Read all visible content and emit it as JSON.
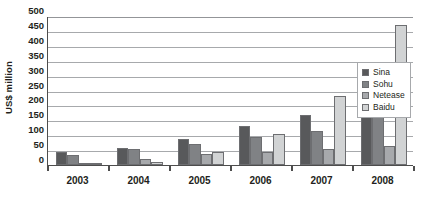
{
  "chart_data": {
    "type": "bar",
    "title": "",
    "xlabel": "",
    "ylabel": "US$ million",
    "ylim": [
      0,
      500
    ],
    "ytick_step": 50,
    "yticks": [
      0,
      50,
      100,
      150,
      200,
      250,
      300,
      350,
      400,
      450,
      500
    ],
    "grid": true,
    "legend_position": "right",
    "categories": [
      "2003",
      "2004",
      "2005",
      "2006",
      "2007",
      "2008"
    ],
    "series": [
      {
        "name": "Sina",
        "color": "#58595b",
        "values": [
          45,
          58,
          87,
          130,
          168,
          260
        ]
      },
      {
        "name": "Sohu",
        "color": "#808285",
        "values": [
          33,
          55,
          72,
          95,
          115,
          172
        ]
      },
      {
        "name": "Netease",
        "color": "#a7a9ac",
        "values": [
          8,
          20,
          37,
          45,
          55,
          65
        ]
      },
      {
        "name": "Baidu",
        "color": "#d1d3d4",
        "values": [
          3,
          9,
          42,
          105,
          233,
          470
        ]
      }
    ]
  },
  "legend": {
    "items": [
      {
        "label": "Sina"
      },
      {
        "label": "Sohu"
      },
      {
        "label": "Netease"
      },
      {
        "label": "Baidu"
      }
    ]
  },
  "axis": {
    "y_title": "US$ million"
  }
}
